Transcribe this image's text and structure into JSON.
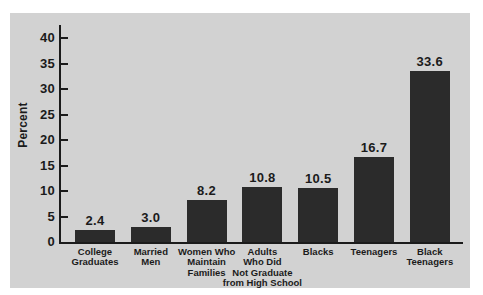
{
  "chart_data": {
    "type": "bar",
    "title": "",
    "xlabel": "",
    "ylabel": "Percent",
    "ylim": [
      0,
      40
    ],
    "yticks": [
      0,
      5,
      10,
      15,
      20,
      25,
      30,
      35,
      40
    ],
    "grid": false,
    "legend": "none",
    "categories": [
      "College Graduates",
      "Married Men",
      "Women Who Maintain Families",
      "Adults Who Did Not Graduate from High School",
      "Blacks",
      "Teenagers",
      "Black Teenagers"
    ],
    "category_label_lines": [
      [
        "College",
        "Graduates"
      ],
      [
        "Married",
        "Men"
      ],
      [
        "Women Who",
        "Maintain",
        "Families"
      ],
      [
        "Adults",
        "Who Did",
        "Not Graduate",
        "from High School"
      ],
      [
        "Blacks"
      ],
      [
        "Teenagers"
      ],
      [
        "Black",
        "Teenagers"
      ]
    ],
    "values": [
      2.4,
      3.0,
      8.2,
      10.8,
      10.5,
      16.7,
      33.6
    ],
    "value_labels": [
      "2.4",
      "3.0",
      "8.2",
      "10.8",
      "10.5",
      "16.7",
      "33.6"
    ],
    "colors": {
      "bar": "#2b2b2b",
      "panel_bg": "#d2d2d2",
      "outer_bg": "#ffffff",
      "axis": "#1b1b1b",
      "text": "#1b1b1b"
    }
  }
}
